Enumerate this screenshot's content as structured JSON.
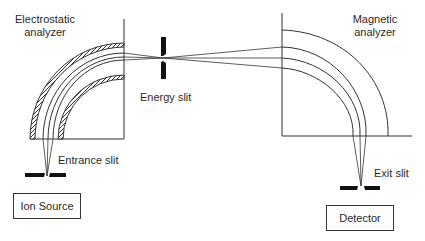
{
  "figure": {
    "labels": {
      "electrostatic_line1": "Electrostatic",
      "electrostatic_line2": "analyzer",
      "magnetic_line1": "Magnetic",
      "magnetic_line2": "analyzer",
      "energy_slit": "Energy slit",
      "entrance_slit": "Entrance slit",
      "exit_slit": "Exit slit"
    },
    "boxes": {
      "ion_source": "Ion Source",
      "detector": "Detector"
    },
    "colors": {
      "line": "#333333",
      "slit": "#111111",
      "background": "#ffffff"
    }
  }
}
